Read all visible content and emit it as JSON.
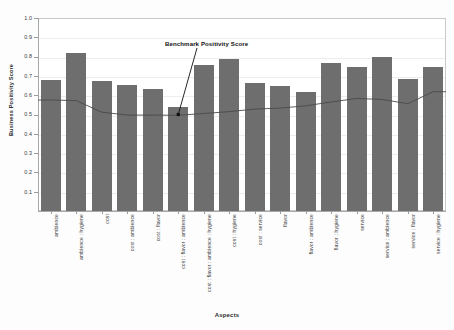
{
  "chart_data": {
    "type": "bar",
    "title": "",
    "xlabel": "Aspects",
    "ylabel": "Business Positivity Score",
    "ylim": [
      0.0,
      1.0
    ],
    "ytick_labels": [
      "1.0",
      "0.9",
      "0.8",
      "0.7",
      "0.6",
      "0.5",
      "0.4",
      "0.3",
      "0.2",
      "0.1"
    ],
    "ytick_values": [
      1.0,
      0.9,
      0.8,
      0.7,
      0.6,
      0.5,
      0.4,
      0.3,
      0.2,
      0.1
    ],
    "grid": true,
    "legend": "none",
    "bar_color": "#6e6e6e",
    "line_color": "#4a4a4a",
    "categories": [
      "ambience",
      "ambience : hygiene",
      "cost",
      "cost : ambience",
      "cost : flavor",
      "cost : flavor : ambience",
      "cost : flavor : ambience : hygiene",
      "cost : hygiene",
      "cost : service",
      "flavor",
      "flavor : ambience",
      "flavor : hygiene",
      "service",
      "service : ambience",
      "service : flavor",
      "service : hygiene"
    ],
    "values": [
      0.68,
      0.82,
      0.675,
      0.655,
      0.63,
      0.54,
      0.755,
      0.785,
      0.665,
      0.65,
      0.615,
      0.765,
      0.745,
      0.8,
      0.685,
      0.745
    ],
    "series": [
      {
        "name": "Business Positivity Score",
        "type": "bar",
        "values": [
          0.68,
          0.82,
          0.675,
          0.655,
          0.63,
          0.54,
          0.755,
          0.785,
          0.665,
          0.65,
          0.615,
          0.765,
          0.745,
          0.8,
          0.685,
          0.745
        ]
      },
      {
        "name": "Benchmark Positivity Score",
        "type": "line",
        "values": [
          0.575,
          0.572,
          0.512,
          0.497,
          0.497,
          0.496,
          0.505,
          0.515,
          0.528,
          0.533,
          0.545,
          0.565,
          0.583,
          0.578,
          0.556,
          0.618
        ]
      }
    ],
    "annotations": [
      {
        "text": "Benchmark Positivity Score",
        "target_category": "cost : flavor : ambience",
        "target_value": 0.5
      }
    ]
  }
}
